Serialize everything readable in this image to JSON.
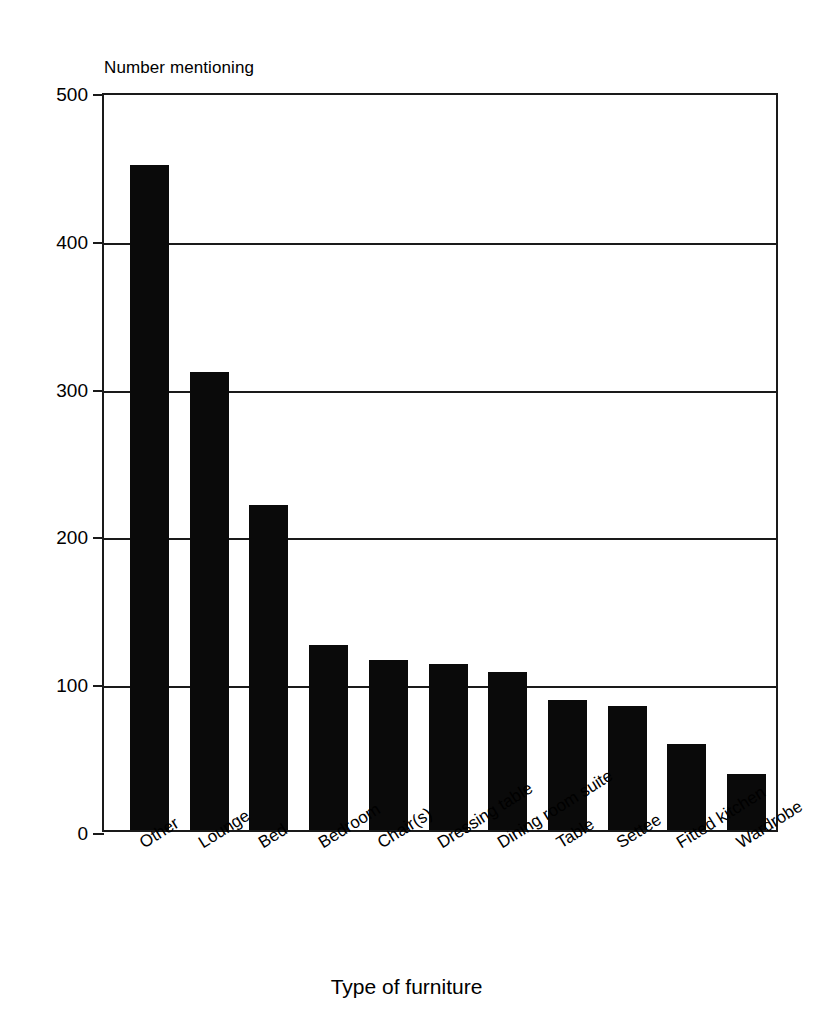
{
  "chart_data": {
    "type": "bar",
    "title": "",
    "ylabel": "Number mentioning",
    "xlabel": "Type of furniture",
    "ylim": [
      0,
      500
    ],
    "yticks": [
      0,
      100,
      200,
      300,
      400,
      500
    ],
    "ytick_labels": [
      "0",
      "100",
      "200",
      "300",
      "400",
      "500"
    ],
    "grid": "horizontal",
    "legend": "none",
    "bar_color": "#0a0a0a",
    "categories": [
      "Other",
      "Lounge",
      "Bed",
      "Bedroom",
      "Chair(s)",
      "Dressing table",
      "Dining room suite",
      "Table",
      "Settee",
      "Fitted kitchen",
      "Wardrobe"
    ],
    "values": [
      450,
      310,
      220,
      125,
      115,
      112,
      107,
      88,
      84,
      58,
      38
    ]
  }
}
